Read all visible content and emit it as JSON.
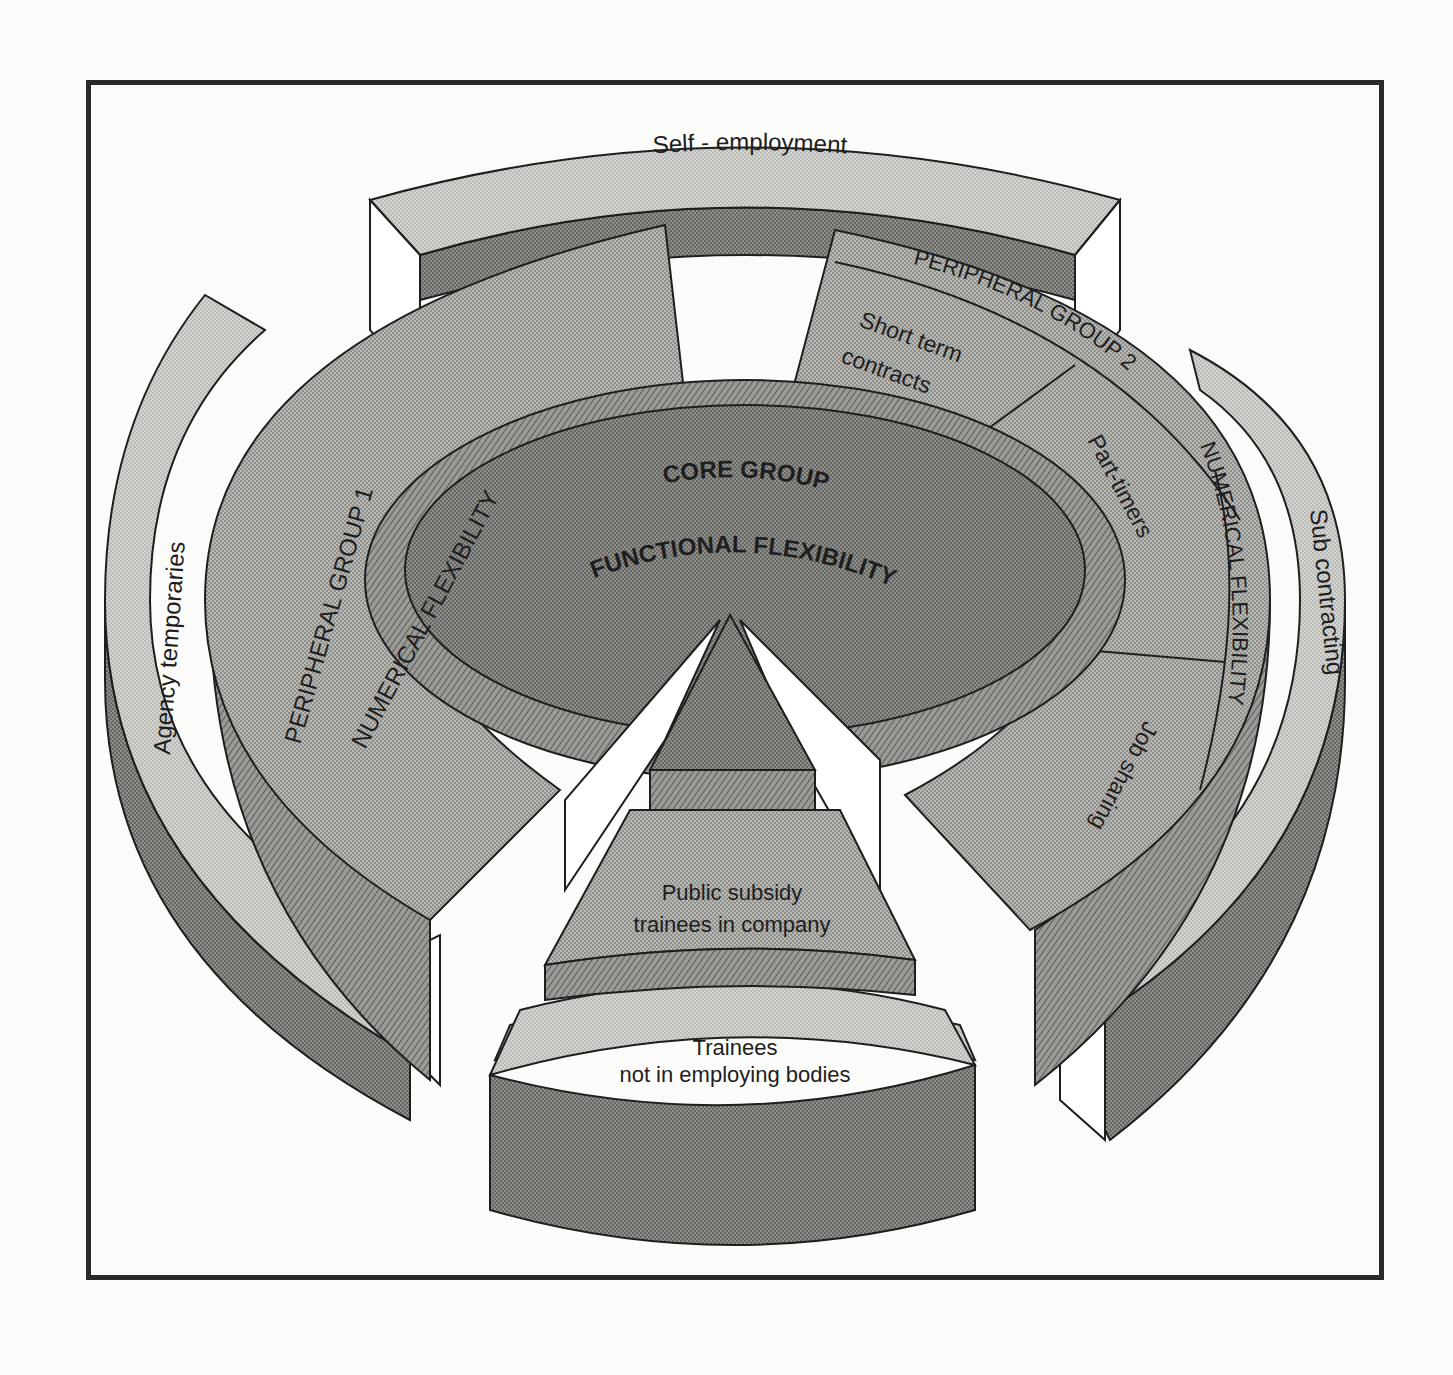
{
  "diagram": {
    "colors": {
      "frame": "#2a2a2a",
      "outline": "#1e1e1e",
      "light": "#d9d9d6",
      "medium": "#b3b3b0",
      "dark": "#8e8e8b",
      "darker": "#6f6f6c",
      "white": "#ffffff"
    },
    "outer_ring": {
      "top": "Self - employment",
      "left": "Agency temporaries",
      "right": "Sub contracting",
      "bottom_line1": "Trainees",
      "bottom_line2": "not in employing bodies"
    },
    "peripheral_group_1": {
      "title": "PERIPHERAL GROUP 1",
      "subtitle": "NUMERICAL FLEXIBILITY"
    },
    "peripheral_group_2": {
      "title": "PERIPHERAL GROUP 2",
      "subtitle": "NUMERICAL FLEXIBILITY",
      "segments": [
        "Short term contracts",
        "Part-timers",
        "Job sharing"
      ],
      "short_term_line1": "Short term",
      "short_term_line2": "contracts",
      "part_timers": "Part-timers",
      "job_sharing": "Job sharing"
    },
    "core": {
      "title": "CORE GROUP",
      "subtitle": "FUNCTIONAL FLEXIBILITY"
    },
    "bottom_wedge": {
      "line1": "Public subsidy",
      "line2": "trainees in company"
    }
  }
}
